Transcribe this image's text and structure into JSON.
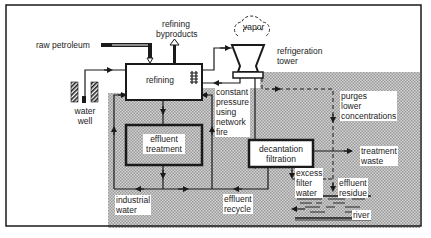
{
  "diagram": {
    "labels": {
      "raw_petroleum": "raw petroleum",
      "refining_byproducts_1": "refining",
      "refining_byproducts_2": "byproducts",
      "vapor": "vapor",
      "refrigeration_tower_1": "refrigeration",
      "refrigeration_tower_2": "tower",
      "refining": "refining",
      "water_well_1": "water",
      "water_well_2": "well",
      "constant_pressure_1": "constant",
      "constant_pressure_2": "pressure",
      "constant_pressure_3": "using",
      "constant_pressure_4": "network",
      "constant_pressure_5": "fire",
      "purges_1": "purges",
      "purges_2": "lower",
      "purges_3": "concentrations",
      "effluent_treatment_1": "effluent",
      "effluent_treatment_2": "treatment",
      "decantation_1": "decantation",
      "decantation_2": "filtration",
      "treatment_waste_1": "treatment",
      "treatment_waste_2": "waste",
      "excess_filter_water_1": "excess",
      "excess_filter_water_2": "filter",
      "excess_filter_water_3": "water",
      "effluent_residue_1": "effluent",
      "effluent_residue_2": "residue",
      "industrial_water_1": "industrial",
      "industrial_water_2": "water",
      "effluent_recycle_1": "effluent",
      "effluent_recycle_2": "recycle",
      "river": "river"
    },
    "colors": {
      "line": "#1a1a1a",
      "shade": "#bdbdbd",
      "background": "#ffffff"
    }
  }
}
